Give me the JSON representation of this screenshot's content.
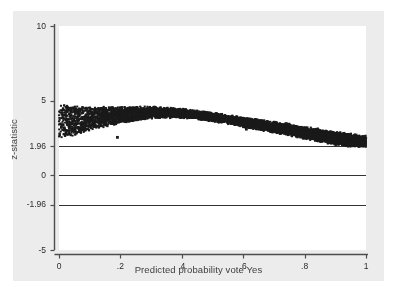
{
  "figure": {
    "background_color": "#ececed",
    "plot_background_color": "#ffffff",
    "marker_color": "#1a1a1a",
    "axis_color": "#4d4d4d",
    "reference_line_color": "#333333"
  },
  "chart_data": {
    "type": "scatter",
    "title": "",
    "xlabel": "Predicted probability vote Yes",
    "ylabel": "z-statistic",
    "xlim": [
      0,
      1
    ],
    "ylim": [
      -5,
      10
    ],
    "grid": false,
    "legend": null,
    "xticks": [
      0,
      0.2,
      0.4,
      0.6,
      0.8,
      1
    ],
    "xticklabels": [
      "0",
      ".2",
      ".4",
      ".6",
      ".8",
      "1"
    ],
    "yticks": [
      10,
      5,
      1.96,
      0,
      -1.96,
      -5
    ],
    "yticklabels": [
      "10",
      "5",
      "1.96",
      "0",
      "-1.96",
      "-5"
    ],
    "reference_lines": [
      {
        "y": 1.96,
        "label": "1.96"
      },
      {
        "y": 0,
        "label": "0"
      },
      {
        "y": -1.96,
        "label": "-1.96"
      }
    ],
    "band_description": "Dense point cloud forming a band that rises slightly from x=0 to a maximum near x=0.3 then declines steadily toward x=1",
    "band_upper": [
      {
        "x": 0.0,
        "y": 4.75
      },
      {
        "x": 0.05,
        "y": 4.6
      },
      {
        "x": 0.1,
        "y": 4.55
      },
      {
        "x": 0.15,
        "y": 4.55
      },
      {
        "x": 0.2,
        "y": 4.55
      },
      {
        "x": 0.25,
        "y": 4.55
      },
      {
        "x": 0.3,
        "y": 4.55
      },
      {
        "x": 0.35,
        "y": 4.5
      },
      {
        "x": 0.4,
        "y": 4.4
      },
      {
        "x": 0.45,
        "y": 4.3
      },
      {
        "x": 0.5,
        "y": 4.15
      },
      {
        "x": 0.55,
        "y": 4.0
      },
      {
        "x": 0.6,
        "y": 3.85
      },
      {
        "x": 0.65,
        "y": 3.7
      },
      {
        "x": 0.7,
        "y": 3.55
      },
      {
        "x": 0.75,
        "y": 3.4
      },
      {
        "x": 0.8,
        "y": 3.2
      },
      {
        "x": 0.85,
        "y": 3.05
      },
      {
        "x": 0.9,
        "y": 2.9
      },
      {
        "x": 0.95,
        "y": 2.75
      },
      {
        "x": 1.0,
        "y": 2.6
      }
    ],
    "band_lower": [
      {
        "x": 0.0,
        "y": 2.5
      },
      {
        "x": 0.05,
        "y": 2.7
      },
      {
        "x": 0.1,
        "y": 3.05
      },
      {
        "x": 0.15,
        "y": 3.3
      },
      {
        "x": 0.2,
        "y": 3.5
      },
      {
        "x": 0.25,
        "y": 3.7
      },
      {
        "x": 0.3,
        "y": 3.85
      },
      {
        "x": 0.35,
        "y": 3.9
      },
      {
        "x": 0.4,
        "y": 3.9
      },
      {
        "x": 0.45,
        "y": 3.8
      },
      {
        "x": 0.5,
        "y": 3.65
      },
      {
        "x": 0.55,
        "y": 3.5
      },
      {
        "x": 0.6,
        "y": 3.3
      },
      {
        "x": 0.65,
        "y": 3.1
      },
      {
        "x": 0.7,
        "y": 2.9
      },
      {
        "x": 0.75,
        "y": 2.7
      },
      {
        "x": 0.8,
        "y": 2.5
      },
      {
        "x": 0.85,
        "y": 2.3
      },
      {
        "x": 0.9,
        "y": 2.1
      },
      {
        "x": 0.95,
        "y": 1.95
      },
      {
        "x": 1.0,
        "y": 1.95
      }
    ],
    "outliers": [
      {
        "x": 0.19,
        "y": 2.55
      },
      {
        "x": 0.61,
        "y": 3.1
      }
    ],
    "n_points": 6000
  }
}
